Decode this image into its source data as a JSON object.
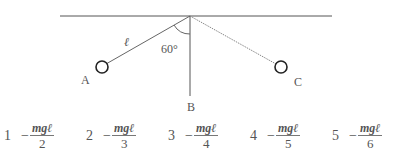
{
  "figure": {
    "labels": {
      "length": "ℓ",
      "angle": "60°",
      "point_a": "A",
      "point_b": "B",
      "point_c": "C"
    }
  },
  "choices": [
    {
      "number": "1",
      "sign": "−",
      "numerator": "mgℓ",
      "denominator": "2"
    },
    {
      "number": "2",
      "sign": "−",
      "numerator": "mgℓ",
      "denominator": "3"
    },
    {
      "number": "3",
      "sign": "−",
      "numerator": "mgℓ",
      "denominator": "4"
    },
    {
      "number": "4",
      "sign": "−",
      "numerator": "mgℓ",
      "denominator": "5"
    },
    {
      "number": "5",
      "sign": "−",
      "numerator": "mgℓ",
      "denominator": "6"
    }
  ]
}
